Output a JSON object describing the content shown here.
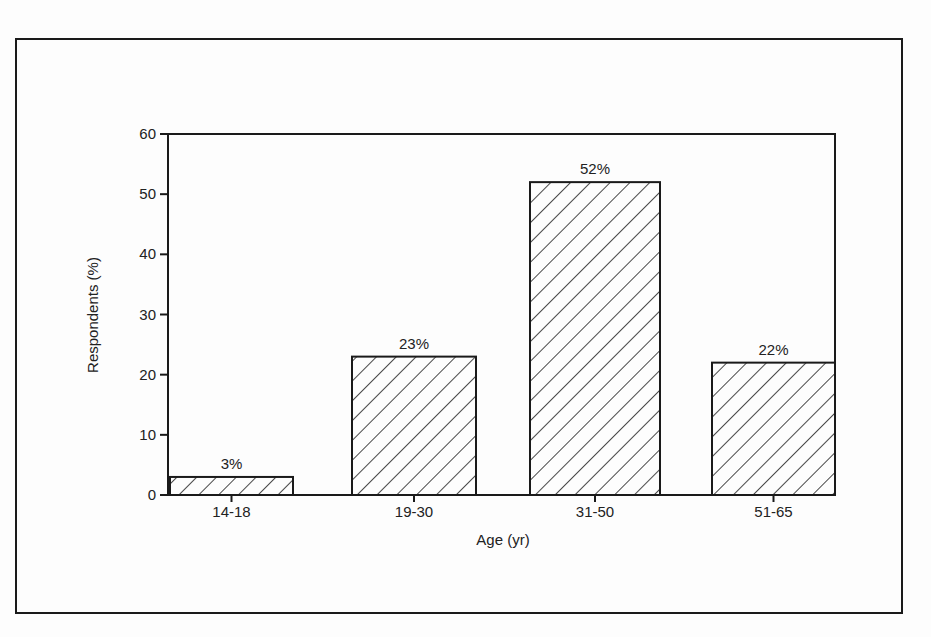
{
  "chart_data": {
    "type": "bar",
    "title": "",
    "xlabel": "Age (yr)",
    "ylabel": "Respondents (%)",
    "categories": [
      "14-18",
      "19-30",
      "31-50",
      "51-65"
    ],
    "values": [
      3,
      23,
      52,
      22
    ],
    "value_labels": [
      "3%",
      "23%",
      "52%",
      "22%"
    ],
    "ylim": [
      0,
      60
    ],
    "yticks": [
      0,
      10,
      20,
      30,
      40,
      50,
      60
    ],
    "grid": false,
    "legend": null,
    "bar_fill": "diagonal-hatch",
    "colors": {
      "ink": "#1a1a1a",
      "background": "#fdfdfd"
    }
  }
}
